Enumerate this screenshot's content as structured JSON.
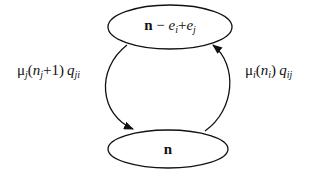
{
  "diagram": {
    "nodes": [
      {
        "id": "top",
        "label_bold": "n",
        "label_rest_minus": " − ",
        "e1": "e",
        "e1_sub": "i",
        "plus": "+",
        "e2": "e",
        "e2_sub": "j",
        "full_label": "n − e_i + e_j"
      },
      {
        "id": "bottom",
        "label_bold": "n",
        "full_label": "n"
      }
    ],
    "edges": [
      {
        "from": "top",
        "to": "bottom",
        "side": "left",
        "label": {
          "mu": "μ",
          "mu_sub": "j",
          "open": "(",
          "n": "n",
          "n_sub": "j",
          "plus_one": "+1)",
          "q": "q",
          "q_sub": "ji"
        },
        "full_label": "μ_j(n_j+1) q_ji"
      },
      {
        "from": "bottom",
        "to": "top",
        "side": "right",
        "label": {
          "mu": "μ",
          "mu_sub": "i",
          "open": "(",
          "n": "n",
          "n_sub": "i",
          "close": ")",
          "q": "q",
          "q_sub": "ij"
        },
        "full_label": "μ_i(n_i) q_ij"
      }
    ],
    "colors": {
      "stroke": "#111111",
      "background": "#ffffff"
    }
  }
}
